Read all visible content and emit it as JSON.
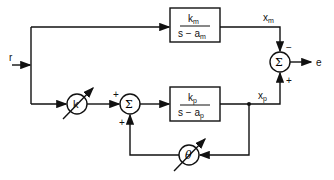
{
  "diagram": {
    "type": "block-diagram",
    "input": {
      "label": "r"
    },
    "output": {
      "label": "e"
    },
    "model_block": {
      "numerator": "k",
      "numerator_sub": "m",
      "denominator": "s − a",
      "denominator_sub": "m"
    },
    "plant_block": {
      "numerator": "k",
      "numerator_sub": "p",
      "denominator": "s − a",
      "denominator_sub": "p"
    },
    "gain_k": {
      "label": "k"
    },
    "gain_theta": {
      "label": "θ"
    },
    "sum_middle": {
      "symbol": "Σ",
      "sign_left": "+",
      "sign_bottom": "+"
    },
    "sum_right": {
      "symbol": "Σ",
      "sign_top": "−",
      "sign_bottom": "+"
    },
    "signal_xm": {
      "label": "x",
      "sub": "m"
    },
    "signal_xp": {
      "label": "x",
      "sub": "p"
    }
  }
}
